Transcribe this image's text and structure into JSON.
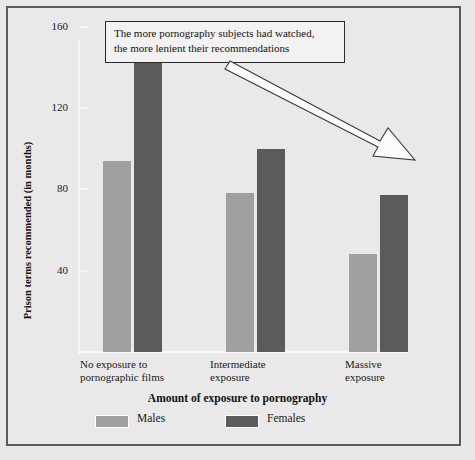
{
  "chart_data": {
    "type": "bar",
    "title": "",
    "subtitle": "",
    "xlabel": "Amount of exposure to pornography",
    "ylabel": "Prison terms recommended (in months)",
    "categories": [
      "No exposure to pornographic films",
      "Intermediate exposure",
      "Massive exposure"
    ],
    "category_lines": [
      [
        "No exposure to",
        "pornographic films"
      ],
      [
        "Intermediate",
        "exposure"
      ],
      [
        "Massive",
        "exposure"
      ]
    ],
    "series": [
      {
        "name": "Males",
        "values": [
          94,
          78,
          48
        ],
        "color": "#a0a0a0"
      },
      {
        "name": "Females",
        "values": [
          143,
          100,
          77
        ],
        "color": "#5b5b5b"
      }
    ],
    "ylim": [
      0,
      170
    ],
    "yticks": [
      40,
      80,
      120,
      160
    ],
    "ytick_labels": [
      "40",
      "80",
      "120",
      "160"
    ],
    "grid": false,
    "legend_position": "bottom-left",
    "annotations": [
      {
        "text_lines": [
          "The more pornography subjects had watched,",
          "the more lenient their recommendations"
        ],
        "arrow": "points down-right toward the Massive exposure group"
      }
    ]
  },
  "legend": {
    "items": [
      {
        "label": "Males",
        "color": "#a0a0a0"
      },
      {
        "label": "Females",
        "color": "#5b5b5b"
      }
    ]
  },
  "colors": {
    "background": "#e9e9e9",
    "frame": "#5a5a5a",
    "males": "#a0a0a0",
    "females": "#5b5b5b",
    "axis": "#f7f7f7",
    "text": "#1a1a1a"
  }
}
